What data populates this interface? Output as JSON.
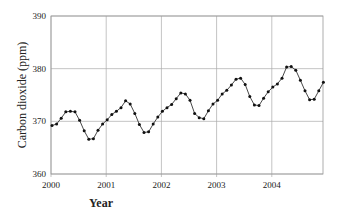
{
  "chart_data": {
    "type": "line",
    "title": "",
    "xlabel": "Year",
    "ylabel": "Carbon dioxide (ppm)",
    "ylim": [
      360,
      390
    ],
    "xlim": [
      2000,
      2005
    ],
    "yticks": [
      360,
      370,
      380,
      390
    ],
    "xticks": [
      "2000",
      "2001",
      "2002",
      "2003",
      "2004"
    ],
    "grid": true,
    "legend": "none",
    "series": [
      {
        "name": "Monthly CO2",
        "marker": "circle",
        "values": [
          369.2,
          369.5,
          370.6,
          371.8,
          371.9,
          371.8,
          370.2,
          368.2,
          366.6,
          366.7,
          368.3,
          369.5,
          370.3,
          371.3,
          371.9,
          372.6,
          373.9,
          373.3,
          371.5,
          369.4,
          367.9,
          368.0,
          369.5,
          370.8,
          371.9,
          372.6,
          373.2,
          374.3,
          375.4,
          375.2,
          374.0,
          371.5,
          370.7,
          370.5,
          372.0,
          373.3,
          374.0,
          375.2,
          375.9,
          376.9,
          378.0,
          378.2,
          377.0,
          374.7,
          373.1,
          373.0,
          374.4,
          375.6,
          376.5,
          377.1,
          378.2,
          380.3,
          380.4,
          379.7,
          377.8,
          375.8,
          374.1,
          374.2,
          375.8,
          377.4
        ]
      }
    ]
  }
}
